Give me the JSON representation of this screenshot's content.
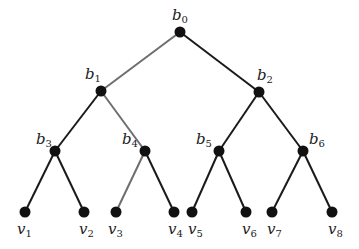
{
  "diagram": {
    "type": "binary-tree",
    "colors": {
      "edge_dark": "#1a1a1a",
      "edge_grey": "#6e6e6e",
      "node": "#111111"
    },
    "nodes": [
      {
        "id": "b0",
        "base": "b",
        "sub": "0",
        "x": 180,
        "y": 32,
        "lx": 172,
        "ly": 20
      },
      {
        "id": "b1",
        "base": "b",
        "sub": "1",
        "x": 101,
        "y": 91,
        "lx": 85,
        "ly": 79
      },
      {
        "id": "b2",
        "base": "b",
        "sub": "2",
        "x": 259,
        "y": 92,
        "lx": 257,
        "ly": 80
      },
      {
        "id": "b3",
        "base": "b",
        "sub": "3",
        "x": 55,
        "y": 151,
        "lx": 36,
        "ly": 144
      },
      {
        "id": "b4",
        "base": "b",
        "sub": "4",
        "x": 145,
        "y": 151,
        "lx": 122,
        "ly": 144
      },
      {
        "id": "b5",
        "base": "b",
        "sub": "5",
        "x": 219,
        "y": 151,
        "lx": 196,
        "ly": 144
      },
      {
        "id": "b6",
        "base": "b",
        "sub": "6",
        "x": 303,
        "y": 151,
        "lx": 309,
        "ly": 144
      },
      {
        "id": "v1",
        "base": "v",
        "sub": "1",
        "x": 25,
        "y": 212,
        "lx": 17,
        "ly": 234
      },
      {
        "id": "v2",
        "base": "v",
        "sub": "2",
        "x": 84,
        "y": 212,
        "lx": 79,
        "ly": 234
      },
      {
        "id": "v3",
        "base": "v",
        "sub": "3",
        "x": 116,
        "y": 212,
        "lx": 108,
        "ly": 234
      },
      {
        "id": "v4",
        "base": "v",
        "sub": "4",
        "x": 174,
        "y": 212,
        "lx": 168,
        "ly": 234
      },
      {
        "id": "v5",
        "base": "v",
        "sub": "5",
        "x": 192,
        "y": 212,
        "lx": 188,
        "ly": 234
      },
      {
        "id": "v6",
        "base": "v",
        "sub": "6",
        "x": 246,
        "y": 212,
        "lx": 242,
        "ly": 234
      },
      {
        "id": "v7",
        "base": "v",
        "sub": "7",
        "x": 272,
        "y": 212,
        "lx": 267,
        "ly": 234
      },
      {
        "id": "v8",
        "base": "v",
        "sub": "8",
        "x": 332,
        "y": 212,
        "lx": 328,
        "ly": 234
      }
    ],
    "edges": [
      {
        "from": "b0",
        "to": "b1",
        "style": "grey"
      },
      {
        "from": "b0",
        "to": "b2",
        "style": "dark"
      },
      {
        "from": "b1",
        "to": "b3",
        "style": "dark"
      },
      {
        "from": "b1",
        "to": "b4",
        "style": "grey"
      },
      {
        "from": "b2",
        "to": "b5",
        "style": "dark"
      },
      {
        "from": "b2",
        "to": "b6",
        "style": "dark"
      },
      {
        "from": "b3",
        "to": "v1",
        "style": "dark"
      },
      {
        "from": "b3",
        "to": "v2",
        "style": "dark"
      },
      {
        "from": "b4",
        "to": "v3",
        "style": "grey"
      },
      {
        "from": "b4",
        "to": "v4",
        "style": "dark"
      },
      {
        "from": "b5",
        "to": "v5",
        "style": "dark"
      },
      {
        "from": "b5",
        "to": "v6",
        "style": "dark"
      },
      {
        "from": "b6",
        "to": "v7",
        "style": "dark"
      },
      {
        "from": "b6",
        "to": "v8",
        "style": "dark"
      }
    ]
  }
}
